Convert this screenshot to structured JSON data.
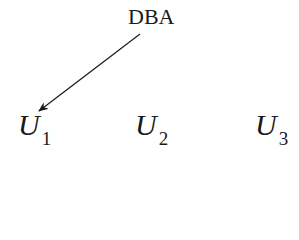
{
  "diagram": {
    "source_node": {
      "label": "DBA"
    },
    "nodes": [
      {
        "label": "U",
        "subscript": "1"
      },
      {
        "label": "U",
        "subscript": "2"
      },
      {
        "label": "U",
        "subscript": "3"
      }
    ],
    "edges": [
      {
        "from": "DBA",
        "to": "U1",
        "directed": true
      }
    ],
    "colors": {
      "ink": "#1a1a1a",
      "background": "#ffffff"
    }
  }
}
